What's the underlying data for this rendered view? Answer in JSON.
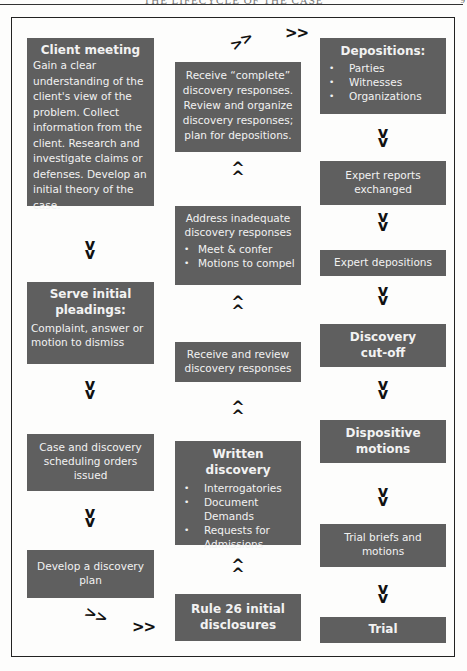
{
  "page": {
    "header_text": "THE LIFECYCLE OF THE CASE",
    "page_number": "9"
  },
  "arrow_glyphs": {
    "down": "v",
    "up": "^",
    "right": ">>"
  },
  "diagram": {
    "left_column": [
      {
        "title": "Client meeting",
        "body": "Gain a clear understanding of the client's view of the problem. Collect information from the client. Research and investigate claims or defenses. Develop an initial theory of the case."
      },
      {
        "title": "Serve initial pleadings:",
        "body": "Complaint, answer or motion to dismiss"
      },
      {
        "title": "",
        "body": "Case and discovery scheduling orders issued"
      },
      {
        "title": "",
        "body": "Develop a discovery plan"
      }
    ],
    "middle_column": [
      {
        "title": "",
        "body": "Receive “complete” discovery responses. Review and organize discovery responses; plan for depositions."
      },
      {
        "title": "",
        "body": "Address inadequate discovery responses",
        "bullets": [
          "Meet & confer",
          "Motions to compel"
        ]
      },
      {
        "title": "",
        "body": "Receive and review discovery responses"
      },
      {
        "title": "Written discovery",
        "bullets": [
          "Interrogatories",
          "Document Demands",
          "Requests for Admissions"
        ]
      },
      {
        "title": "Rule 26 initial disclosures"
      }
    ],
    "right_column": [
      {
        "title": "Depositions:",
        "bullets": [
          "Parties",
          "Witnesses",
          "Organizations"
        ]
      },
      {
        "title": "",
        "body": "Expert reports exchanged"
      },
      {
        "title": "",
        "body": "Expert depositions"
      },
      {
        "title": "Discovery cut-off"
      },
      {
        "title": "Dispositive motions"
      },
      {
        "title": "",
        "body": "Trial briefs and motions"
      },
      {
        "title": "Trial"
      }
    ]
  }
}
